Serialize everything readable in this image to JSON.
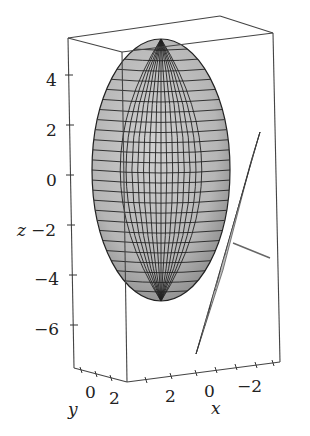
{
  "chart_data": {
    "type": "surface3d",
    "title": "",
    "surfaces": [
      {
        "name": "ellipsoid",
        "shape": "ellipsoid",
        "center": [
          0,
          0,
          0
        ],
        "semi_axes_approx": [
          3,
          3,
          5
        ],
        "fill": "#b9b9b9",
        "mesh": true
      },
      {
        "name": "tangent-plane",
        "shape": "plane",
        "fill": "#c4c4c4",
        "mesh": true
      },
      {
        "name": "normal-line",
        "shape": "line",
        "color": "#666666"
      }
    ],
    "axes": {
      "x": {
        "label": "x",
        "ticks": [
          "2",
          "0",
          "−2"
        ]
      },
      "y": {
        "label": "y",
        "ticks": [
          "0",
          "2"
        ]
      },
      "z": {
        "label": "z",
        "ticks": [
          "4",
          "2",
          "0",
          "−2",
          "−4",
          "−6"
        ]
      }
    },
    "zlim": [
      -7,
      5
    ],
    "grid": false,
    "legend": null
  },
  "labels": {
    "z_axis": "z",
    "x_axis": "x",
    "y_axis": "y",
    "z_ticks": [
      "4",
      "2",
      "0",
      "−2",
      "−4",
      "−6"
    ],
    "x_ticks": [
      "2",
      "0",
      "−2"
    ],
    "y_ticks": [
      "0",
      "2"
    ]
  }
}
